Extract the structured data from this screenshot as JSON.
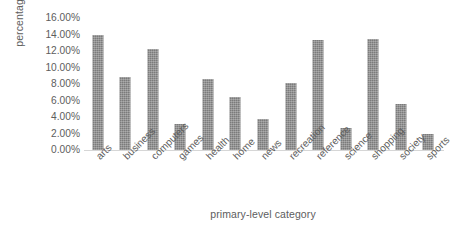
{
  "chart_data": {
    "type": "bar",
    "title": "",
    "xlabel": "primary-level category",
    "ylabel": "percentage",
    "categories": [
      "arts",
      "business",
      "computers",
      "games",
      "health",
      "home",
      "news",
      "recreation",
      "reference",
      "science",
      "shopping",
      "society",
      "sports"
    ],
    "values": [
      13.9,
      8.9,
      12.3,
      3.1,
      8.6,
      6.4,
      3.7,
      8.1,
      13.3,
      2.7,
      13.5,
      5.6,
      1.9
    ],
    "ylim": [
      0,
      16
    ],
    "ytick_labels": [
      "16.00%",
      "14.00%",
      "12.00%",
      "10.00%",
      "8.00%",
      "6.00%",
      "4.00%",
      "2.00%",
      "0.00%"
    ],
    "ytick_values": [
      16,
      14,
      12,
      10,
      8,
      6,
      4,
      2,
      0
    ],
    "grid": false,
    "legend": "none",
    "bar_color": "#7b7b7b",
    "axis_color": "#d6d6d6",
    "text_color": "#5d5d5d"
  }
}
